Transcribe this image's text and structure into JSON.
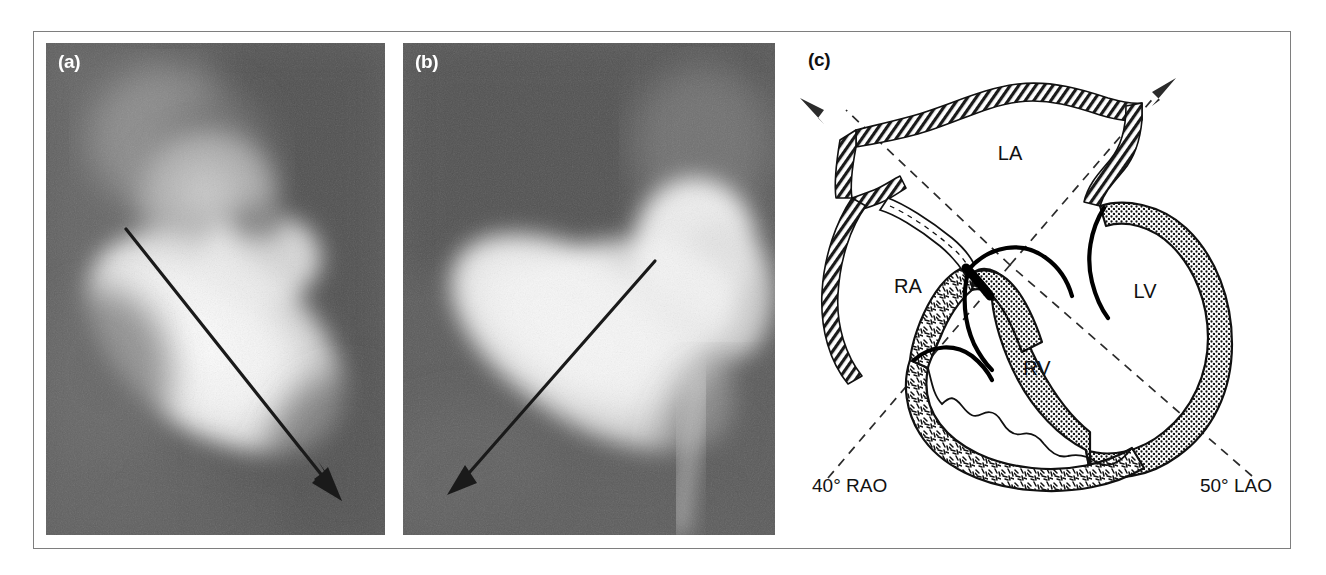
{
  "figure": {
    "type": "medical-figure",
    "panel_count": 3,
    "border_color": "#7e7e7e",
    "background_color": "#ffffff"
  },
  "panels": {
    "a": {
      "letter": "(a)",
      "kind": "angiogram",
      "letter_color": "#ffffff",
      "background_color": "#585858",
      "contrast_color": "#f2f2f2",
      "annotation": {
        "name": "long-axis-arrow",
        "style": "solid-line-with-arrowhead",
        "color": "#1a1a1a",
        "direction": "down-right",
        "from": "upper-left",
        "to": "lower-right"
      }
    },
    "b": {
      "letter": "(b)",
      "kind": "angiogram",
      "letter_color": "#ffffff",
      "background_color": "#585858",
      "contrast_color": "#f2f2f2",
      "annotation": {
        "name": "long-axis-arrow",
        "style": "solid-line-with-arrowhead",
        "color": "#1a1a1a",
        "direction": "down-left",
        "from": "upper-right",
        "to": "lower-left"
      }
    },
    "c": {
      "letter": "(c)",
      "kind": "line-diagram",
      "letter_color": "#111111",
      "background_color": "#ffffff",
      "line_color": "#000000"
    }
  },
  "diagram": {
    "chambers": [
      {
        "id": "LA",
        "label": "LA",
        "name": "left-atrium",
        "x": 1010,
        "y": 160
      },
      {
        "id": "RA",
        "label": "RA",
        "name": "right-atrium",
        "x": 908,
        "y": 293
      },
      {
        "id": "LV",
        "label": "LV",
        "name": "left-ventricle",
        "x": 1145,
        "y": 298
      },
      {
        "id": "RV",
        "label": "RV",
        "name": "right-ventricle",
        "x": 1037,
        "y": 375
      }
    ],
    "projections": [
      {
        "id": "rao",
        "label": "40° RAO",
        "name": "rao-projection-axis",
        "angle_degrees": 40,
        "view": "RAO",
        "direction": "upper-left",
        "label_x": 812,
        "label_y": 492,
        "line_style": "dashed",
        "has_arrowhead": true
      },
      {
        "id": "lao",
        "label": "50° LAO",
        "name": "lao-projection-axis",
        "angle_degrees": 50,
        "view": "LAO",
        "direction": "upper-right",
        "label_x": 1185,
        "label_y": 492,
        "line_style": "dashed",
        "has_arrowhead": true
      }
    ],
    "structures": [
      {
        "name": "great-vessel-wall",
        "texture": "hatched-tube"
      },
      {
        "name": "lv-myocardium",
        "texture": "fine-dotted"
      },
      {
        "name": "rv-myocardium",
        "texture": "dash-trabeculated"
      },
      {
        "name": "interventricular-septum",
        "texture": "fine-dotted"
      },
      {
        "name": "tricuspid-valve",
        "texture": "solid-black-leaflets"
      },
      {
        "name": "mitral-valve",
        "texture": "solid-black-leaflets"
      },
      {
        "name": "catheter",
        "texture": "dashed-outline-tube"
      }
    ]
  }
}
